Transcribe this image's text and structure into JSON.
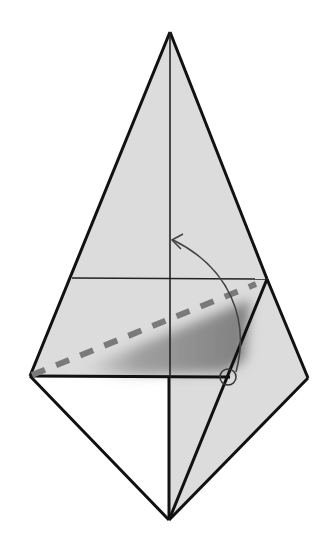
{
  "diagram": {
    "type": "origami-fold-step",
    "canvas": {
      "width": 330,
      "height": 542,
      "background": "#ffffff"
    },
    "colors": {
      "paper_fill": "#dcdcdc",
      "paper_white": "#ffffff",
      "edge_stroke": "#111111",
      "crease_stroke": "#222222",
      "valley_fold_dash": "#7a7a7a",
      "shadow": "#6e6e6e",
      "arrow": "#444444"
    },
    "points": {
      "top_apex": [
        170,
        32
      ],
      "left_vertex": [
        30,
        376
      ],
      "right_vertex": [
        308,
        378
      ],
      "bottom_vertex": [
        169,
        520
      ],
      "center_on_horizontal": [
        169,
        377
      ],
      "upper_crease_left": [
        72,
        278
      ],
      "upper_crease_right": [
        267,
        279
      ],
      "reference_circle": [
        228,
        377
      ]
    },
    "annotations": {
      "valley_fold_line": {
        "from": [
          30,
          376
        ],
        "to": [
          256,
          284
        ],
        "style": "dashed"
      },
      "fold_arrow": {
        "from": [
          236,
          372
        ],
        "to": [
          172,
          240
        ],
        "direction": "up-left",
        "head": "open"
      },
      "reference_circle_radius": 8
    }
  }
}
